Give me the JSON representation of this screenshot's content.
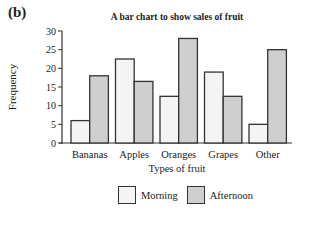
{
  "panel_label": "(b)",
  "colors": {
    "morning": "#f4f4f4",
    "afternoon": "#cfcfcf",
    "outline": "#333333"
  },
  "chart_data": {
    "type": "bar",
    "title": "A bar chart to show sales of fruit",
    "xlabel": "Types of fruit",
    "ylabel": "Frequency",
    "categories": [
      "Bananas",
      "Apples",
      "Oranges",
      "Grapes",
      "Other"
    ],
    "series": [
      {
        "name": "Morning",
        "values": [
          6,
          22.5,
          12.5,
          19,
          5
        ]
      },
      {
        "name": "Afternoon",
        "values": [
          18,
          16.5,
          28,
          12.5,
          25
        ]
      }
    ],
    "ylim": [
      0,
      30
    ],
    "yticks": [
      0,
      5,
      10,
      15,
      20,
      25,
      30
    ],
    "grid": false,
    "legend_position": "bottom"
  }
}
